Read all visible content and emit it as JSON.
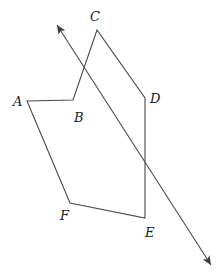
{
  "figure": {
    "background_color": "#ffffff",
    "stroke_color": "#4a4a4a",
    "label_color": "#1a1a1a",
    "stroke_width": 1.1,
    "width": 224,
    "height": 272
  },
  "polygon": {
    "name": "hexagon-abcdef",
    "closed": true,
    "vertices": [
      {
        "id": "A",
        "label": "A",
        "x": 27,
        "y": 101,
        "label_x": 13,
        "label_y": 95
      },
      {
        "id": "B",
        "label": "B",
        "x": 73,
        "y": 100,
        "label_x": 74,
        "label_y": 111
      },
      {
        "id": "C",
        "label": "C",
        "x": 97,
        "y": 30,
        "label_x": 90,
        "label_y": 10
      },
      {
        "id": "D",
        "label": "D",
        "x": 145,
        "y": 98,
        "label_x": 150,
        "label_y": 92
      },
      {
        "id": "E",
        "label": "E",
        "x": 145,
        "y": 218,
        "label_x": 145,
        "label_y": 226
      },
      {
        "id": "F",
        "label": "F",
        "x": 70,
        "y": 203,
        "label_x": 60,
        "label_y": 209
      }
    ],
    "edges": [
      {
        "from": "A",
        "to": "B"
      },
      {
        "from": "B",
        "to": "C"
      },
      {
        "from": "C",
        "to": "D"
      },
      {
        "from": "D",
        "to": "E"
      },
      {
        "from": "E",
        "to": "F"
      },
      {
        "from": "F",
        "to": "A"
      }
    ]
  },
  "arrow_line": {
    "name": "double-headed-arrow-line",
    "start": {
      "x": 57,
      "y": 25
    },
    "end": {
      "x": 211,
      "y": 265
    },
    "start_arrowhead": true,
    "end_arrowhead": true,
    "arrowhead_length": 9,
    "arrowhead_width": 4
  }
}
